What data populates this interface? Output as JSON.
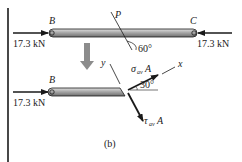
{
  "figure": {
    "caption": "(b)",
    "colors": {
      "line": "#1a1a1a",
      "bar_fill": "#9a9a9a",
      "bar_highlight": "#d4d4d4",
      "arrow_gray": "#8c8c8c"
    }
  },
  "top_member": {
    "left_label": "B",
    "right_label": "C",
    "left_force": "17.3 kN",
    "right_force": "17.3 kN",
    "plane_label": "P",
    "plane_angle": "60°"
  },
  "section": {
    "left_label": "B",
    "left_force": "17.3 kN",
    "axis_x": "x",
    "axis_y": "y",
    "normal_force": {
      "symbol": "σ",
      "subscript": "av",
      "suffix": "A"
    },
    "shear_force": {
      "symbol": "τ",
      "subscript": "av",
      "suffix": "A"
    },
    "angle": "30°"
  }
}
